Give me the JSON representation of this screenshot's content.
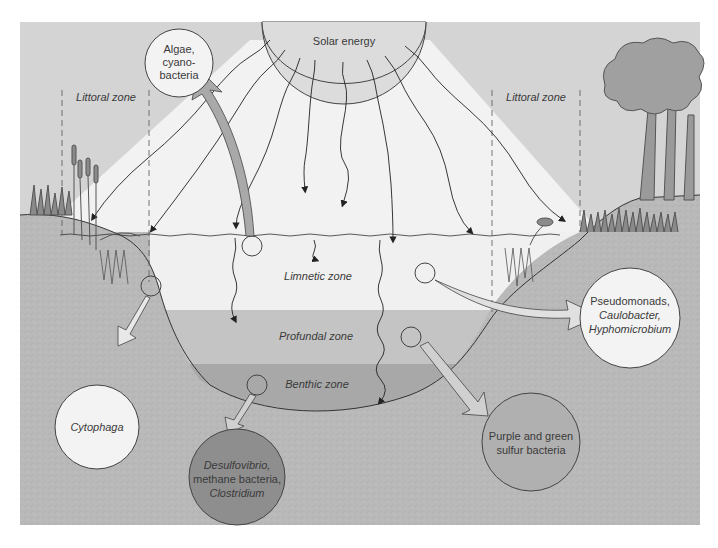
{
  "diagram": {
    "source": {
      "label": "Solar energy"
    },
    "zones": {
      "littoral_left": "Littoral zone",
      "littoral_right": "Littoral zone",
      "limnetic": "Limnetic zone",
      "profundal": "Profundal zone",
      "benthic": "Benthic zone"
    },
    "organisms": {
      "algae": {
        "line1": "Algae,",
        "line2": "cyano-",
        "line3": "bacteria"
      },
      "cytophaga": {
        "line1": "Cytophaga"
      },
      "pseudomonads": {
        "line1": "Pseudomonads,",
        "line2": "Caulobacter,",
        "line3": "Hyphomicrobium"
      },
      "purple_green": {
        "line1": "Purple and green",
        "line2": "sulfur bacteria"
      },
      "desulfovibrio": {
        "line1": "Desulfovibrio,",
        "line2": "methane bacteria,",
        "line3": "Clostridium"
      }
    },
    "colors": {
      "sky": "#d4d4d4",
      "light_beam": "#f2f2f2",
      "limnetic": "#f0f0f0",
      "profundal": "#c4c4c4",
      "benthic": "#a8a8a8",
      "sediment": "#b8b8b8",
      "circle_light": "#f3f3f3",
      "circle_mid": "#b0b0b0",
      "circle_dark": "#8e8e8e",
      "outline": "#444444"
    }
  }
}
